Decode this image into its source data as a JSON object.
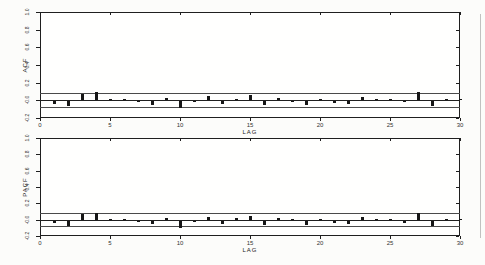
{
  "page": {
    "background": "#fcfcfa",
    "frame_color": "#1f1f1f",
    "bar_color": "#161616",
    "band_color": "#4a4a4a",
    "text_color": "#2a2a2a"
  },
  "chart_data": [
    {
      "type": "bar",
      "name": "acf-correlogram",
      "title": "",
      "ylabel": "ACF",
      "xlabel": "LAG",
      "xlim": [
        0,
        30
      ],
      "ylim": [
        -0.2,
        1.0
      ],
      "grid": false,
      "legend": "none",
      "zero_line": 0.0,
      "confidence_band": 0.08,
      "ytick_labels": [
        "1.0",
        "0.8",
        "0.6",
        "0.4",
        "0.2",
        "-0.0",
        "-0.2"
      ],
      "ytick_values": [
        1.0,
        0.8,
        0.6,
        0.4,
        0.2,
        0.0,
        -0.2
      ],
      "xtick_labels": [
        "0",
        "5",
        "10",
        "15",
        "20",
        "25",
        "30"
      ],
      "xtick_values": [
        0,
        5,
        10,
        15,
        20,
        25,
        30
      ],
      "lags": [
        1,
        2,
        3,
        4,
        5,
        6,
        7,
        8,
        9,
        10,
        11,
        12,
        13,
        14,
        15,
        16,
        17,
        18,
        19,
        20,
        21,
        22,
        23,
        24,
        25,
        26,
        27,
        28,
        29,
        30
      ],
      "values": [
        -0.03,
        -0.06,
        0.07,
        0.09,
        0.01,
        0.0,
        -0.01,
        -0.04,
        0.02,
        -0.08,
        -0.01,
        0.04,
        -0.035,
        0.01,
        0.055,
        -0.05,
        0.025,
        -0.01,
        -0.045,
        0.015,
        -0.02,
        -0.035,
        0.035,
        0.01,
        0.01,
        -0.015,
        0.09,
        -0.06,
        0.01,
        0.0
      ]
    },
    {
      "type": "bar",
      "name": "pacf-correlogram",
      "title": "",
      "ylabel": "PACF",
      "xlabel": "LAG",
      "xlim": [
        0,
        30
      ],
      "ylim": [
        -0.2,
        1.0
      ],
      "grid": false,
      "legend": "none",
      "zero_line": 0.0,
      "confidence_band": 0.08,
      "ytick_labels": [
        "1.0",
        "0.8",
        "0.6",
        "0.4",
        "0.2",
        "-0.0",
        "-0.2"
      ],
      "ytick_values": [
        1.0,
        0.8,
        0.6,
        0.4,
        0.2,
        0.0,
        -0.2
      ],
      "xtick_labels": [
        "0",
        "5",
        "10",
        "15",
        "20",
        "25",
        "30"
      ],
      "xtick_values": [
        0,
        5,
        10,
        15,
        20,
        25,
        30
      ],
      "lags": [
        1,
        2,
        3,
        4,
        5,
        6,
        7,
        8,
        9,
        10,
        11,
        12,
        13,
        14,
        15,
        16,
        17,
        18,
        19,
        20,
        21,
        22,
        23,
        24,
        25,
        26,
        27,
        28,
        29,
        30
      ],
      "values": [
        -0.03,
        -0.06,
        0.07,
        0.09,
        0.01,
        0.01,
        -0.01,
        -0.04,
        0.02,
        -0.09,
        -0.01,
        0.04,
        -0.04,
        0.03,
        0.05,
        -0.05,
        0.03,
        0.01,
        -0.05,
        0.01,
        -0.03,
        -0.035,
        0.04,
        0.01,
        0.01,
        -0.02,
        0.09,
        -0.06,
        0.01,
        0.0
      ]
    }
  ]
}
